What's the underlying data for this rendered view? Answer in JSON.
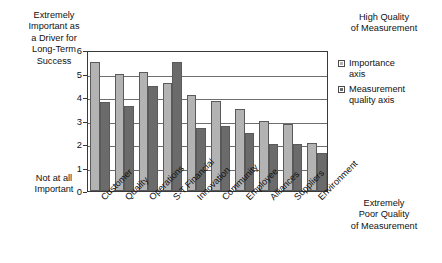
{
  "captions": {
    "top_left": "Extremely\nImportant as\na Driver for\nLong-Term\nSuccess",
    "bottom_left": "Not at all\nImportant",
    "top_right": "High Quality\nof Measurement",
    "bottom_right": "Extremely\nPoor Quality\nof Measurement"
  },
  "legend": {
    "items": [
      {
        "label": "Importance\naxis",
        "color": "#b3b3b3",
        "swatch": "light-square-icon"
      },
      {
        "label": "Measurement\nquality axis",
        "color": "#6b6b6b",
        "swatch": "dark-square-icon"
      }
    ]
  },
  "chart_data": {
    "type": "bar",
    "title": "",
    "xlabel": "",
    "ylabel": "",
    "ylim": [
      0,
      6
    ],
    "yticks": [
      0,
      1,
      2,
      3,
      4,
      5,
      6
    ],
    "ytick_labels": [
      "0",
      "1",
      "2",
      "3",
      "4",
      "5",
      "6"
    ],
    "grid": true,
    "legend_position": "right",
    "categories": [
      "Customer",
      "Quality",
      "Operations",
      "S-T Financial",
      "Innovation",
      "Community",
      "Employee",
      "Alliances",
      "Suppliers",
      "Environment"
    ],
    "series": [
      {
        "name": "Importance axis",
        "color": "#b3b3b3",
        "values": [
          5.5,
          5.0,
          5.05,
          4.6,
          4.1,
          3.85,
          3.5,
          3.0,
          2.85,
          2.05
        ]
      },
      {
        "name": "Measurement quality axis",
        "color": "#6b6b6b",
        "values": [
          3.8,
          3.6,
          4.45,
          5.5,
          2.7,
          2.75,
          2.45,
          2.0,
          2.0,
          1.6
        ]
      }
    ],
    "annotations": {
      "y_axis_top_meaning": "Extremely Important as a Driver for Long-Term Success / High Quality of Measurement",
      "y_axis_bottom_meaning": "Not at all Important / Extremely Poor Quality of Measurement"
    }
  }
}
